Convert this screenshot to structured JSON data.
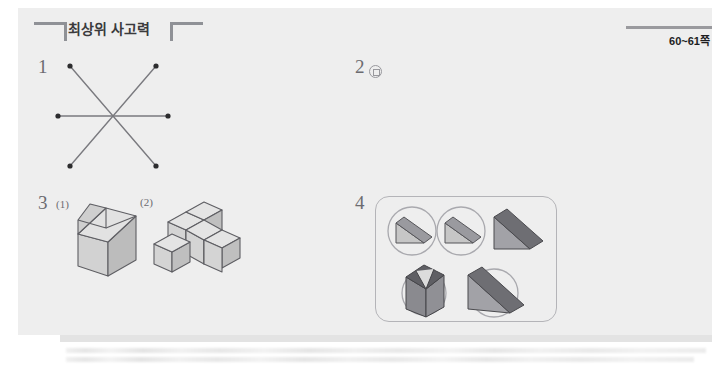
{
  "header": {
    "title": "최상위 사고력",
    "page_label": "60~61쪽",
    "bracket_left_icon": "bracket-left-icon",
    "bracket_right_icon": "bracket-right-icon"
  },
  "problems": [
    {
      "number": "1",
      "figure": "three-lines-through-common-point",
      "description": "Six endpoint dots joined by three straight lines meeting at one central point"
    },
    {
      "number": "2",
      "figure": "circled-square-symbol",
      "answer_glyph": "◎"
    },
    {
      "number": "3",
      "sub_labels": [
        "(1)",
        "(2)"
      ],
      "figures": [
        "beveled-cube-solid",
        "staircase-unit-cube-solid"
      ]
    },
    {
      "number": "4",
      "figure": "wedge-solids-panel",
      "items": [
        {
          "shape": "wedge-prism",
          "circled": true
        },
        {
          "shape": "wedge-prism",
          "circled": true
        },
        {
          "shape": "wedge-prism",
          "circled": false
        },
        {
          "shape": "folded-v-solid",
          "circled": true
        },
        {
          "shape": "large-wedge-prism",
          "circled": true
        }
      ]
    }
  ],
  "colors": {
    "page_background": "#eeeeee",
    "header_bracket": "#8f9196",
    "header_text": "#3a3a3c",
    "line_stroke": "#7a7a7f",
    "solid_light": "#dcdcdc",
    "solid_mid": "#c4c4c4",
    "solid_dark": "#a8a8a8",
    "wedge_dark": "#6e6e73",
    "wedge_mid": "#8e8e93",
    "panel_border": "#b4b4b8"
  }
}
